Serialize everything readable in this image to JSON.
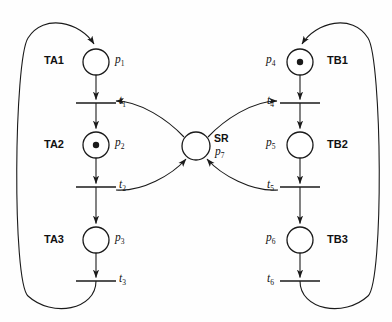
{
  "diagram": {
    "type": "petri-net",
    "title": "",
    "canvas": {
      "width": 392,
      "height": 322,
      "background": "#fefefe"
    },
    "stroke_color": "#1a1a1a",
    "groups": [
      {
        "id": "TA1",
        "label": "TA1",
        "side": "left",
        "x": 44,
        "y": 57
      },
      {
        "id": "TA2",
        "label": "TA2",
        "side": "left",
        "x": 44,
        "y": 140
      },
      {
        "id": "TA3",
        "label": "TA3",
        "side": "left",
        "x": 44,
        "y": 235
      },
      {
        "id": "TB1",
        "label": "TB1",
        "side": "right",
        "x": 327,
        "y": 57
      },
      {
        "id": "TB2",
        "label": "TB2",
        "side": "right",
        "x": 327,
        "y": 140
      },
      {
        "id": "TB3",
        "label": "TB3",
        "side": "right",
        "x": 327,
        "y": 235
      },
      {
        "id": "SR",
        "label": "SR",
        "side": "center",
        "x": 214,
        "y": 134
      }
    ],
    "places": [
      {
        "id": "p1",
        "label": "p",
        "sub": "1",
        "cx": 96,
        "cy": 62,
        "r": 13,
        "tokens": 0,
        "label_x": 115,
        "label_y": 55
      },
      {
        "id": "p2",
        "label": "p",
        "sub": "2",
        "cx": 96,
        "cy": 145,
        "r": 13,
        "tokens": 1,
        "label_x": 115,
        "label_y": 138
      },
      {
        "id": "p3",
        "label": "p",
        "sub": "3",
        "cx": 96,
        "cy": 240,
        "r": 13,
        "tokens": 0,
        "label_x": 115,
        "label_y": 233
      },
      {
        "id": "p4",
        "label": "p",
        "sub": "4",
        "cx": 300,
        "cy": 62,
        "r": 13,
        "tokens": 1,
        "label_x": 268,
        "label_y": 55
      },
      {
        "id": "p5",
        "label": "p",
        "sub": "5",
        "cx": 300,
        "cy": 145,
        "r": 13,
        "tokens": 0,
        "label_x": 268,
        "label_y": 138
      },
      {
        "id": "p6",
        "label": "p",
        "sub": "6",
        "cx": 300,
        "cy": 240,
        "r": 13,
        "tokens": 0,
        "label_x": 268,
        "label_y": 233
      },
      {
        "id": "p7",
        "label": "p",
        "sub": "7",
        "cx": 196,
        "cy": 146,
        "r": 14,
        "tokens": 0,
        "label_x": 214,
        "label_y": 146
      }
    ],
    "transitions": [
      {
        "id": "t1",
        "label": "t",
        "sub": "1",
        "x": 96,
        "y": 103,
        "width": 40,
        "label_x": 114,
        "label_y": 96
      },
      {
        "id": "t2",
        "label": "t",
        "sub": "2",
        "x": 96,
        "y": 187,
        "width": 40,
        "label_x": 114,
        "label_y": 180
      },
      {
        "id": "t3",
        "label": "t",
        "sub": "3",
        "x": 96,
        "y": 281,
        "width": 40,
        "label_x": 114,
        "label_y": 274
      },
      {
        "id": "t4",
        "label": "t",
        "sub": "4",
        "x": 300,
        "y": 103,
        "width": 40,
        "label_x": 269,
        "label_y": 96
      },
      {
        "id": "t5",
        "label": "t",
        "sub": "5",
        "x": 300,
        "y": 187,
        "width": 40,
        "label_x": 269,
        "label_y": 180
      },
      {
        "id": "t6",
        "label": "t",
        "sub": "6",
        "x": 300,
        "y": 281,
        "width": 40,
        "label_x": 269,
        "label_y": 274
      }
    ],
    "arcs": [
      {
        "from": "p1",
        "to": "t1",
        "kind": "straight"
      },
      {
        "from": "t1",
        "to": "p2",
        "kind": "straight"
      },
      {
        "from": "p2",
        "to": "t2",
        "kind": "straight"
      },
      {
        "from": "t2",
        "to": "p3",
        "kind": "straight"
      },
      {
        "from": "p3",
        "to": "t3",
        "kind": "straight"
      },
      {
        "from": "p4",
        "to": "t4",
        "kind": "straight"
      },
      {
        "from": "t4",
        "to": "p5",
        "kind": "straight"
      },
      {
        "from": "p5",
        "to": "t5",
        "kind": "straight"
      },
      {
        "from": "t5",
        "to": "p6",
        "kind": "straight"
      },
      {
        "from": "p6",
        "to": "t6",
        "kind": "straight"
      },
      {
        "from": "p7",
        "to": "t1",
        "kind": "curve"
      },
      {
        "from": "p7",
        "to": "t4",
        "kind": "curve"
      },
      {
        "from": "t2",
        "to": "p7",
        "kind": "curve"
      },
      {
        "from": "t5",
        "to": "p7",
        "kind": "curve"
      },
      {
        "from": "t3",
        "to": "p1",
        "kind": "outer-loop-left"
      },
      {
        "from": "t6",
        "to": "p4",
        "kind": "outer-loop-right"
      }
    ]
  }
}
